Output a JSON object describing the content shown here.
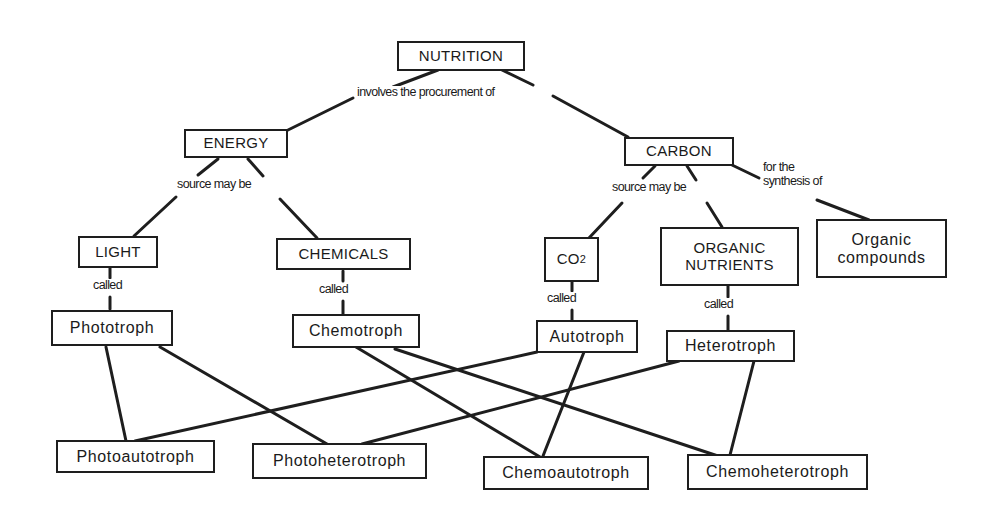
{
  "diagram": {
    "type": "concept-map",
    "title": "NUTRITION",
    "colors": {
      "line": "#1e1e1e",
      "background": "#ffffff",
      "text": "#1a1a1a"
    },
    "nodes": {
      "nutrition": "NUTRITION",
      "energy": "ENERGY",
      "carbon": "CARBON",
      "light": "LIGHT",
      "chemicals": "CHEMICALS",
      "co2_main": "CO",
      "co2_sub": "2",
      "organic_nutrients": "ORGANIC\nNUTRIENTS",
      "organic_compounds": "Organic\ncompounds",
      "phototroph": "Phototroph",
      "chemotroph": "Chemotroph",
      "autotroph": "Autotroph",
      "heterotroph": "Heterotroph",
      "photoautotroph": "Photoautotroph",
      "photoheterotroph": "Photoheterotroph",
      "chemoautotroph": "Chemoautotroph",
      "chemoheterotroph": "Chemoheterotroph"
    },
    "link_labels": {
      "involves": "involves the procurement of",
      "energy_source": "source may be",
      "carbon_source": "source may be",
      "synthesis": "for the\nsynthesis of",
      "called_light": "called",
      "called_chemicals": "called",
      "called_co2": "called",
      "called_organic": "called"
    },
    "edges": [
      [
        "NUTRITION",
        "ENERGY",
        "involves the procurement of"
      ],
      [
        "NUTRITION",
        "CARBON",
        "involves the procurement of"
      ],
      [
        "ENERGY",
        "LIGHT",
        "source may be"
      ],
      [
        "ENERGY",
        "CHEMICALS",
        "source may be"
      ],
      [
        "CARBON",
        "CO2",
        "source may be"
      ],
      [
        "CARBON",
        "ORGANIC NUTRIENTS",
        "source may be"
      ],
      [
        "CARBON",
        "Organic compounds",
        "for the synthesis of"
      ],
      [
        "LIGHT",
        "Phototroph",
        "called"
      ],
      [
        "CHEMICALS",
        "Chemotroph",
        "called"
      ],
      [
        "CO2",
        "Autotroph",
        "called"
      ],
      [
        "ORGANIC NUTRIENTS",
        "Heterotroph",
        "called"
      ],
      [
        "Phototroph",
        "Photoautotroph",
        ""
      ],
      [
        "Phototroph",
        "Photoheterotroph",
        ""
      ],
      [
        "Chemotroph",
        "Chemoautotroph",
        ""
      ],
      [
        "Chemotroph",
        "Chemoheterotroph",
        ""
      ],
      [
        "Autotroph",
        "Photoautotroph",
        ""
      ],
      [
        "Autotroph",
        "Chemoautotroph",
        ""
      ],
      [
        "Heterotroph",
        "Photoheterotroph",
        ""
      ],
      [
        "Heterotroph",
        "Chemoheterotroph",
        ""
      ]
    ]
  }
}
